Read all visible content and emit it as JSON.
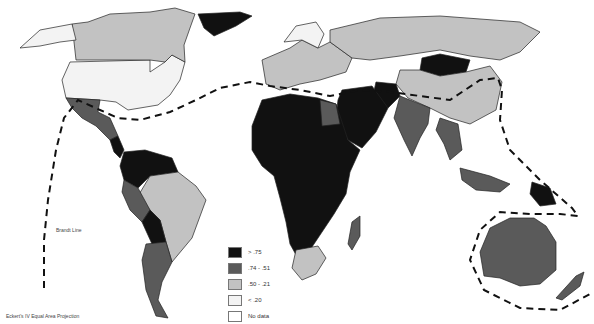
{
  "map": {
    "projection_label": "Eckert's IV Equal Area Projection",
    "brandt_line_label": "Brandt Line",
    "legend": [
      {
        "label": "> .75",
        "color": "#111111"
      },
      {
        "label": ".74 - .51",
        "color": "#5a5a5a"
      },
      {
        "label": ".50 - .21",
        "color": "#c2c2c2"
      },
      {
        "label": "< .20",
        "color": "#f3f3f3"
      },
      {
        "label": "No data",
        "color": "#ffffff"
      }
    ]
  }
}
